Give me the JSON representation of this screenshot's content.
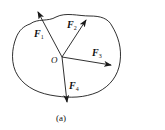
{
  "figure": {
    "caption": "(a)",
    "origin_label": "O",
    "forces": [
      {
        "symbol": "F",
        "subscript": "1"
      },
      {
        "symbol": "F",
        "subscript": "2"
      },
      {
        "symbol": "F",
        "subscript": "3"
      },
      {
        "symbol": "F",
        "subscript": "4"
      }
    ],
    "colors": {
      "stroke": "#1a1a1a",
      "background": "#ffffff"
    }
  }
}
